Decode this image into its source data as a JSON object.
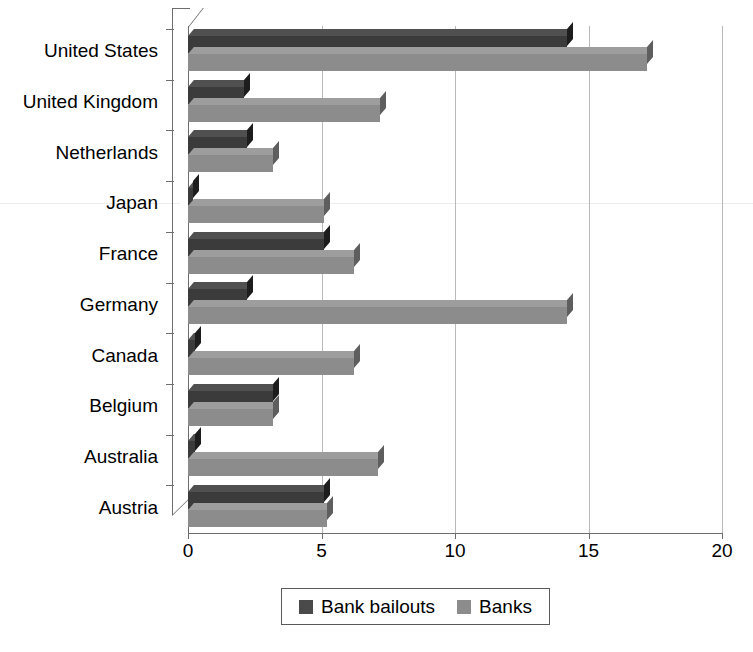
{
  "chart_data": {
    "type": "bar",
    "orientation": "horizontal",
    "title": "",
    "subtitle": "",
    "xlabel": "",
    "ylabel": "",
    "xlim": [
      0,
      20
    ],
    "xticks": [
      "0",
      "5",
      "10",
      "15",
      "20"
    ],
    "xtick_values": [
      0,
      5,
      10,
      15,
      20
    ],
    "grid": true,
    "grid_axis": "x",
    "legend_position": "bottom",
    "style": "3d-bars",
    "categories": [
      "United States",
      "United Kingdom",
      "Netherlands",
      "Japan",
      "France",
      "Germany",
      "Canada",
      "Belgium",
      "Australia",
      "Austria"
    ],
    "series": [
      {
        "name": "Bank bailouts",
        "color": "#3b3b3b",
        "values": [
          14.2,
          2.1,
          2.2,
          0.2,
          5.1,
          2.2,
          0.25,
          3.2,
          0.25,
          5.1
        ]
      },
      {
        "name": "Banks",
        "color": "#8c8c8c",
        "values": [
          17.2,
          7.2,
          3.2,
          5.1,
          6.2,
          14.2,
          6.2,
          3.2,
          7.1,
          5.2
        ]
      }
    ]
  },
  "legend": {
    "entries": [
      {
        "label": "Bank bailouts",
        "swatch": "bailouts"
      },
      {
        "label": "Banks",
        "swatch": "banks"
      }
    ]
  },
  "colors": {
    "bar_dark": "#3b3b3b",
    "bar_light": "#8c8c8c",
    "gridline": "#b9b9b9",
    "axis": "#6e6e6e",
    "background": "#ffffff",
    "text": "#000000"
  }
}
